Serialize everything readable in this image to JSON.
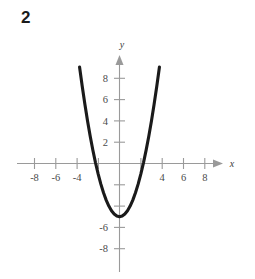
{
  "problem": {
    "number": "2"
  },
  "chart_data": {
    "type": "line",
    "title": "",
    "subtitle": "",
    "xlabel": "x",
    "ylabel": "y",
    "xlim": [
      -9.4,
      9.4
    ],
    "ylim": [
      -9.4,
      9.4
    ],
    "grid": false,
    "legend": null,
    "x_ticks": [
      -8,
      -6,
      -4,
      -2,
      2,
      4,
      6,
      8
    ],
    "x_tick_labels": [
      "-8",
      "-6",
      "-4",
      "",
      "",
      "4",
      "6",
      "8"
    ],
    "y_ticks": [
      -8,
      -6,
      -4,
      -2,
      2,
      4,
      6,
      8
    ],
    "y_tick_labels": [
      "-8",
      "-6",
      "",
      "",
      "2",
      "4",
      "6",
      "8"
    ],
    "series": [
      {
        "name": "parabola",
        "equation": "y = x^2 - 5",
        "color": "#1a1a1a",
        "vertex": [
          0,
          -5
        ],
        "x_intercepts": [
          -2.24,
          2.24
        ],
        "y_intercept": -5,
        "opens": "up",
        "x": [
          -3.75,
          -3.5,
          -3.25,
          -3,
          -2.75,
          -2.5,
          -2.25,
          -2,
          -1.75,
          -1.5,
          -1.25,
          -1,
          -0.75,
          -0.5,
          -0.25,
          0,
          0.25,
          0.5,
          0.75,
          1,
          1.25,
          1.5,
          1.75,
          2,
          2.25,
          2.5,
          2.75,
          3,
          3.25,
          3.5,
          3.75
        ],
        "y": [
          9.06,
          7.25,
          5.56,
          4,
          2.56,
          1.25,
          0.06,
          -1,
          -1.94,
          -2.75,
          -3.44,
          -4,
          -4.44,
          -4.75,
          -4.94,
          -5,
          -4.94,
          -4.75,
          -4.44,
          -4,
          -3.44,
          -2.75,
          -1.94,
          -1,
          0.06,
          1.25,
          2.56,
          4,
          5.56,
          7.25,
          9.06
        ]
      }
    ]
  },
  "axes": {
    "x_axis_label": "x",
    "y_axis_label": "y"
  },
  "colors": {
    "curve": "#1a1a1a",
    "axis": "#9a9a9a",
    "tick_text": "#4a4a4a",
    "background": "#ffffff"
  }
}
